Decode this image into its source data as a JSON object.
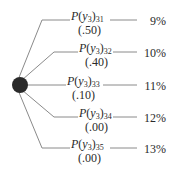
{
  "diagram": {
    "type": "decision-tree-chance-node",
    "node": {
      "shape": "circle",
      "color": "#2a2a2a"
    },
    "branches": [
      {
        "var": "P",
        "arg": "y",
        "arg_sub": "3",
        "sub": "31",
        "prob": "(.50)",
        "outcome": "9%"
      },
      {
        "var": "P",
        "arg": "y",
        "arg_sub": "3",
        "sub": "32",
        "prob": "(.40)",
        "outcome": "10%"
      },
      {
        "var": "P",
        "arg": "y",
        "arg_sub": "3",
        "sub": "33",
        "prob": "(.10)",
        "outcome": "11%"
      },
      {
        "var": "P",
        "arg": "y",
        "arg_sub": "3",
        "sub": "34",
        "prob": "(.00)",
        "outcome": "12%"
      },
      {
        "var": "P",
        "arg": "y",
        "arg_sub": "3",
        "sub": "35",
        "prob": "(.00)",
        "outcome": "13%"
      }
    ]
  }
}
